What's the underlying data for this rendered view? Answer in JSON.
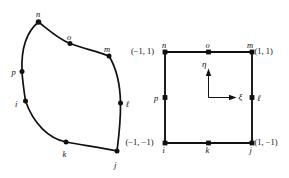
{
  "figure": {
    "type": "diagram",
    "node_ids": [
      "i",
      "j",
      "k",
      "l",
      "m",
      "n",
      "o",
      "p"
    ]
  },
  "physical_element": {
    "labels": {
      "i": "i",
      "j": "j",
      "k": "k",
      "l": "ℓ",
      "m": "m",
      "n": "n",
      "o": "o",
      "p": "p"
    },
    "nodes": [
      {
        "id": "i",
        "label": "i",
        "x": 25.5,
        "y": 101.0,
        "label_dx": -8.5,
        "label_dy": 2.5
      },
      {
        "id": "k",
        "label": "k",
        "x": 66.0,
        "y": 142.0,
        "label_dx": -2.0,
        "label_dy": 12.5
      },
      {
        "id": "j",
        "label": "j",
        "x": 117.0,
        "y": 151.0,
        "label_dx": -1.5,
        "label_dy": 14.0
      },
      {
        "id": "l",
        "label": "ℓ",
        "x": 120.5,
        "y": 103.0,
        "label_dx": 4.0,
        "label_dy": 2.0
      },
      {
        "id": "m",
        "label": "m",
        "x": 109.0,
        "y": 56.0,
        "label_dx": -2.0,
        "label_dy": -5.0
      },
      {
        "id": "o",
        "label": "o",
        "x": 70.0,
        "y": 43.5,
        "label_dx": -1.0,
        "label_dy": -5.0
      },
      {
        "id": "n",
        "label": "n",
        "x": 38.5,
        "y": 22.0,
        "label_dx": -1.0,
        "label_dy": -5.5
      },
      {
        "id": "p",
        "label": "p",
        "x": 22.0,
        "y": 71.5,
        "label_dx": -9.0,
        "label_dy": 1.5
      }
    ]
  },
  "reference_square": {
    "labels": {
      "i": "i",
      "j": "j",
      "k": "k",
      "l": "ℓ",
      "m": "m",
      "n": "n",
      "o": "o",
      "p": "p"
    },
    "corner_coordinates": {
      "n": "(−1, 1)",
      "m": "(1, 1)",
      "i": "(−1, −1)",
      "j": "(1, −1)"
    },
    "axes": {
      "horizontal": "ξ",
      "vertical": "η"
    },
    "nodes": [
      {
        "id": "i",
        "label": "i",
        "x": 165.0,
        "y": 143.0,
        "label_dx": -1.5,
        "label_dy": 13.5
      },
      {
        "id": "k",
        "label": "k",
        "x": 208.5,
        "y": 143.0,
        "label_dx": -2.0,
        "label_dy": 13.5
      },
      {
        "id": "j",
        "label": "j",
        "x": 252.0,
        "y": 143.0,
        "label_dx": -1.5,
        "label_dy": 13.5
      },
      {
        "id": "l",
        "label": "ℓ",
        "x": 252.0,
        "y": 97.5,
        "label_dx": 4.5,
        "label_dy": 2.0
      },
      {
        "id": "m",
        "label": "m",
        "x": 252.0,
        "y": 52.0,
        "label_dx": -3.0,
        "label_dy": -4.5
      },
      {
        "id": "o",
        "label": "o",
        "x": 208.5,
        "y": 52.0,
        "label_dx": -2.0,
        "label_dy": -4.5
      },
      {
        "id": "n",
        "label": "n",
        "x": 165.0,
        "y": 52.0,
        "label_dx": -2.0,
        "label_dy": -4.5
      },
      {
        "id": "p",
        "label": "p",
        "x": 165.0,
        "y": 97.5,
        "label_dx": -9.5,
        "label_dy": 2.0
      }
    ]
  },
  "colors": {
    "stroke": "#111111",
    "background": "#ffffff"
  }
}
